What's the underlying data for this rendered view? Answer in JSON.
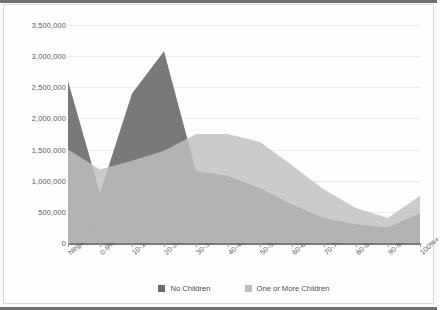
{
  "chart_data": {
    "type": "area",
    "title": "",
    "subtitle": "",
    "xlabel": "",
    "ylabel": "",
    "grid": true,
    "legend_position": "bottom-center",
    "overlap_mode": "overlapping-translucent-areas",
    "categories": [
      "Negative MTR",
      "0-9%",
      "10-19%",
      "20-29%",
      "30-39%",
      "40-49%",
      "50-59%",
      "60-69%",
      "70-79%",
      "80-89%",
      "90-99%",
      "100%+"
    ],
    "ylim": [
      0,
      3500000
    ],
    "ytick_values": [
      0,
      500000,
      1000000,
      1500000,
      2000000,
      2500000,
      3000000,
      3500000
    ],
    "ytick_labels": [
      "0",
      "500,000",
      "1,000,000",
      "1,500,000",
      "2,000,000",
      "2,500,000",
      "3,000,000",
      "3,500,000"
    ],
    "series": [
      {
        "name": "No Children",
        "color": "#6e6e6e",
        "values": [
          2600000,
          800000,
          2400000,
          3080000,
          1150000,
          1080000,
          880000,
          620000,
          400000,
          300000,
          250000,
          480000
        ]
      },
      {
        "name": "One or More Children",
        "color": "#bfbfbf",
        "values": [
          1500000,
          1180000,
          1320000,
          1480000,
          1750000,
          1750000,
          1620000,
          1250000,
          860000,
          560000,
          400000,
          760000
        ]
      }
    ]
  },
  "legend": {
    "items": [
      {
        "label": "No Children",
        "color": "#6e6e6e"
      },
      {
        "label": "One or More Children",
        "color": "#bfbfbf"
      }
    ]
  }
}
